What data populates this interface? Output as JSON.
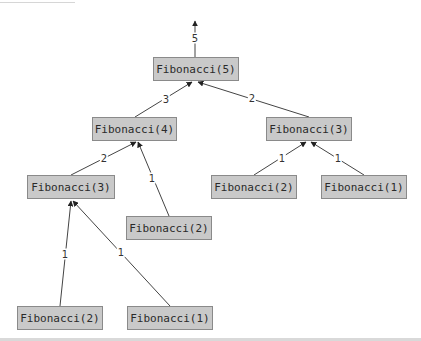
{
  "diagram": {
    "type": "recursion-call-tree",
    "colors": {
      "node_fill": "#c9c9c9",
      "node_border": "#8a8a8a",
      "edge": "#444444",
      "text": "#2a2a2a"
    },
    "result_label": "5",
    "nodes": [
      {
        "id": "n0",
        "label": "Fibonacci(5)",
        "x": 153,
        "y": 57,
        "w": 86
      },
      {
        "id": "n1",
        "label": "Fibonacci(4)",
        "x": 92,
        "y": 117,
        "w": 85
      },
      {
        "id": "n2",
        "label": "Fibonacci(3)",
        "x": 266,
        "y": 117,
        "w": 86
      },
      {
        "id": "n3",
        "label": "Fibonacci(3)",
        "x": 27,
        "y": 175,
        "w": 88
      },
      {
        "id": "n4",
        "label": "Fibonacci(2)",
        "x": 126,
        "y": 216,
        "w": 86
      },
      {
        "id": "n5",
        "label": "Fibonacci(2)",
        "x": 211,
        "y": 175,
        "w": 86
      },
      {
        "id": "n6",
        "label": "Fibonacci(1)",
        "x": 321,
        "y": 175,
        "w": 86
      },
      {
        "id": "n7",
        "label": "Fibonacci(2)",
        "x": 17,
        "y": 306,
        "w": 86
      },
      {
        "id": "n8",
        "label": "Fibonacci(1)",
        "x": 127,
        "y": 306,
        "w": 86
      }
    ],
    "edges": [
      {
        "from": "n0",
        "to": "result",
        "label": "5"
      },
      {
        "from": "n1",
        "to": "n0",
        "label": "3"
      },
      {
        "from": "n2",
        "to": "n0",
        "label": "2"
      },
      {
        "from": "n3",
        "to": "n1",
        "label": "2"
      },
      {
        "from": "n4",
        "to": "n1",
        "label": "1"
      },
      {
        "from": "n5",
        "to": "n2",
        "label": "1"
      },
      {
        "from": "n6",
        "to": "n2",
        "label": "1"
      },
      {
        "from": "n7",
        "to": "n3",
        "label": "1"
      },
      {
        "from": "n8",
        "to": "n3",
        "label": "1"
      }
    ],
    "edge_labels": {
      "e_result": "5",
      "e_n1_n0": "3",
      "e_n2_n0": "2",
      "e_n3_n1": "2",
      "e_n4_n1": "1",
      "e_n5_n2": "1",
      "e_n6_n2": "1",
      "e_n7_n3": "1",
      "e_n8_n3": "1"
    }
  }
}
